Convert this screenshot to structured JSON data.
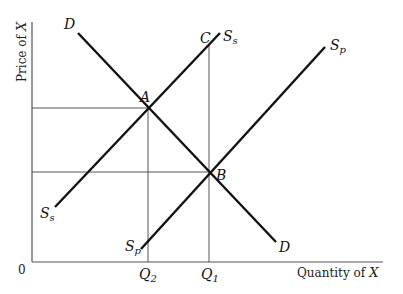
{
  "diagram": {
    "y_axis_label": "Price of",
    "y_axis_var": "X",
    "x_axis_label": "Quantity of",
    "x_axis_var": "X",
    "origin_label": "0",
    "curves": {
      "demand": {
        "label": "D",
        "end_label": "D"
      },
      "supply_s": {
        "label": "S",
        "sub": "s",
        "end_label": "S",
        "end_sub": "s"
      },
      "supply_p": {
        "label": "S",
        "sub": "p",
        "end_label": "S",
        "end_sub": "p"
      }
    },
    "points": {
      "A": "A",
      "B": "B",
      "C": "C"
    },
    "quantities": {
      "q2_main": "Q",
      "q2_sub": "2",
      "q1_main": "Q",
      "q1_sub": "1"
    }
  }
}
